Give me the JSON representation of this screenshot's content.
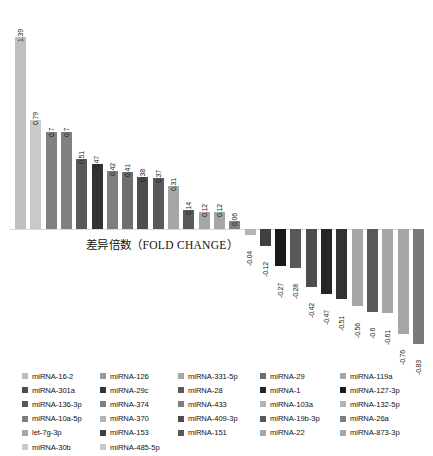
{
  "chart_data": {
    "type": "bar",
    "title": "",
    "xlabel": "差异倍数（FOLD CHANGE）",
    "ylabel": "",
    "grid": false,
    "legend_position": "bottom",
    "ylim": [
      -0.95,
      1.45
    ],
    "categories": [
      "miRNA-16-2",
      "miRNA-301a",
      "miRNA-136-3p",
      "miRNA-10a-5p",
      "let-7g-3p",
      "miRNA-30b",
      "miRNA-126",
      "miRNA-29c",
      "miRNA-374",
      "miRNA-370",
      "miRNA-153",
      "miRNA-485-5p",
      "miRNA-331-5p",
      "miRNA-28",
      "miRNA-433",
      "miRNA-409-3p",
      "miRNA-151",
      "miRNA-29",
      "miRNA-1",
      "miRNA-103a",
      "miRNA-19b-3p",
      "miRNA-22",
      "miRNA-119a",
      "miRNA-127-3p",
      "miRNA-132-5p",
      "miRNA-26a",
      "miRNA-873-3p"
    ],
    "values": [
      1.39,
      0.79,
      0.7,
      0.7,
      0.51,
      0.47,
      0.42,
      0.41,
      0.38,
      0.37,
      0.31,
      0.14,
      0.12,
      0.12,
      0.06,
      -0.04,
      -0.12,
      -0.27,
      -0.28,
      -0.42,
      -0.47,
      -0.51,
      -0.56,
      -0.6,
      -0.61,
      -0.76,
      -0.83
    ],
    "value_labels": [
      "1.39",
      "0.79",
      "0.7",
      "0.7",
      "0.51",
      "0.47",
      "0.42",
      "0.41",
      "0.38",
      "0.37",
      "0.31",
      "0.14",
      "0.12",
      "0.12",
      "0.06",
      "-0.04",
      "-0.12",
      "-0.27",
      "-0.28",
      "-0.42",
      "-0.47",
      "-0.51",
      "-0.56",
      "-0.6",
      "-0.61",
      "-0.76",
      "-0.83"
    ],
    "bar_colors": [
      "#bfbfbf",
      "#c9c9c9",
      "#808080",
      "#808080",
      "#595959",
      "#333333",
      "#7f7f7f",
      "#6e6e6e",
      "#4d4d4d",
      "#595959",
      "#a6a6a6",
      "#595959",
      "#a6a6a6",
      "#a6a6a6",
      "#808080",
      "#b3b3b3",
      "#404040",
      "#1a1a1a",
      "#595959",
      "#4d4d4d",
      "#262626",
      "#333333",
      "#a6a6a6",
      "#595959",
      "#a6a6a6",
      "#a6a6a6",
      "#7a7a7a"
    ]
  },
  "axis": {
    "fold_change_label": "差异倍数（FOLD CHANGE）"
  },
  "legend": {
    "columns": [
      {
        "items": [
          {
            "label": "miRNA-16-2",
            "color": "#bfbfbf"
          },
          {
            "label": "miRNA-301a",
            "color": "#4d4d4d"
          },
          {
            "label": "miRNA-136-3p",
            "color": "#595959"
          },
          {
            "label": "miRNA-10a-5p",
            "color": "#808080"
          },
          {
            "label": "let-7g-3p",
            "color": "#a6a6a6"
          },
          {
            "label": "miRNA-30b",
            "color": "#c9c9c9"
          }
        ]
      },
      {
        "items": [
          {
            "label": "miRNA-126",
            "color": "#9a9a9a"
          },
          {
            "label": "miRNA-29c",
            "color": "#333333"
          },
          {
            "label": "miRNA-374",
            "color": "#808080"
          },
          {
            "label": "miRNA-370",
            "color": "#b3b3b3"
          },
          {
            "label": "miRNA-153",
            "color": "#404040"
          },
          {
            "label": "miRNA-485-5p",
            "color": "#c9c9c9"
          }
        ]
      },
      {
        "items": [
          {
            "label": "miRNA-331-5p",
            "color": "#a6a6a6"
          },
          {
            "label": "miRNA-28",
            "color": "#595959"
          },
          {
            "label": "miRNA-433",
            "color": "#808080"
          },
          {
            "label": "miRNA-409-3p",
            "color": "#4d4d4d"
          },
          {
            "label": "miRNA-151",
            "color": "#595959"
          }
        ]
      },
      {
        "items": [
          {
            "label": "miRNA-29",
            "color": "#6e6e6e"
          },
          {
            "label": "miRNA-1",
            "color": "#262626"
          },
          {
            "label": "miRNA-103a",
            "color": "#b3b3b3"
          },
          {
            "label": "miRNA-19b-3p",
            "color": "#595959"
          },
          {
            "label": "miRNA-22",
            "color": "#a6a6a6"
          }
        ]
      },
      {
        "items": [
          {
            "label": "miRNA-119a",
            "color": "#a6a6a6"
          },
          {
            "label": "miRNA-127-3p",
            "color": "#1a1a1a"
          },
          {
            "label": "miRNA-132-5p",
            "color": "#b3b3b3"
          },
          {
            "label": "miRNA-26a",
            "color": "#808080"
          },
          {
            "label": "miRNA-873-3p",
            "color": "#a6a6a6"
          }
        ]
      }
    ]
  }
}
